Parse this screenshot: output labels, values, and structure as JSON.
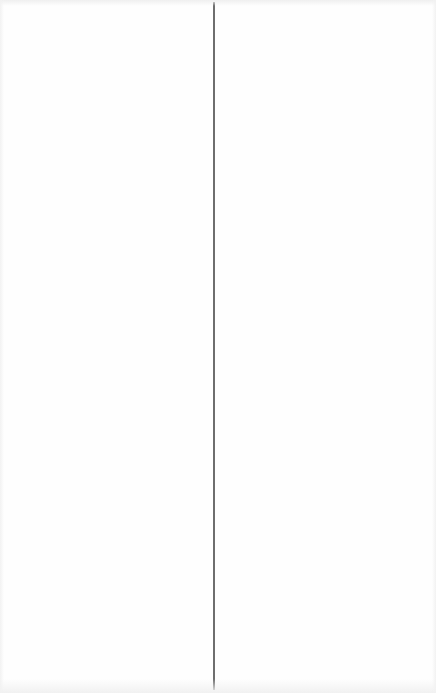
{
  "layout": {
    "panes": [
      {
        "id": "left",
        "content": ""
      },
      {
        "id": "right",
        "content": ""
      }
    ],
    "divider_color": "#6e6e6e",
    "background_color": "#fefefe"
  }
}
